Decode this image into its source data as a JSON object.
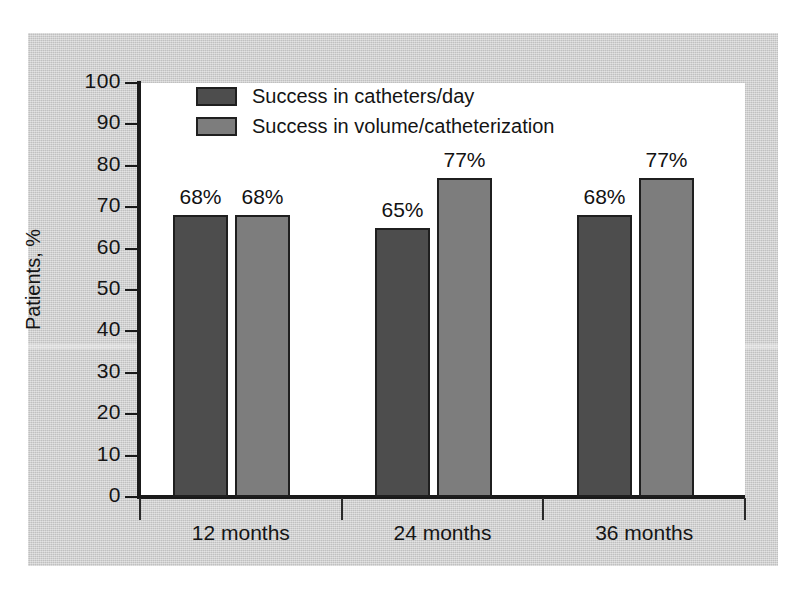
{
  "chart_data": {
    "type": "bar",
    "title": "",
    "xlabel": "",
    "ylabel": "Patients, %",
    "ylim": [
      0,
      100
    ],
    "ytick_step": 10,
    "yticks": [
      100,
      90,
      80,
      70,
      60,
      50,
      40,
      30,
      20,
      10,
      0
    ],
    "ytick_labels": [
      "100",
      "90",
      "80",
      "70",
      "60",
      "50",
      "40",
      "30",
      "20",
      "10",
      "0"
    ],
    "categories": [
      "12 months",
      "24 months",
      "36 months"
    ],
    "grid": false,
    "legend_position": "top-left",
    "series": [
      {
        "name": "Success in catheters/day",
        "color": "#4d4d4d",
        "values": [
          68,
          65,
          68
        ],
        "data_labels": [
          "68%",
          "65%",
          "68%"
        ]
      },
      {
        "name": "Success in volume/catheterization",
        "color": "#7d7d7d",
        "values": [
          68,
          77,
          77
        ],
        "data_labels": [
          "68%",
          "77%",
          "77%"
        ]
      }
    ]
  },
  "figure": {
    "panel_background": "#cccccc",
    "plot_background": "#ffffff",
    "axis_color": "#1a1a1a",
    "text_color": "#151515"
  }
}
